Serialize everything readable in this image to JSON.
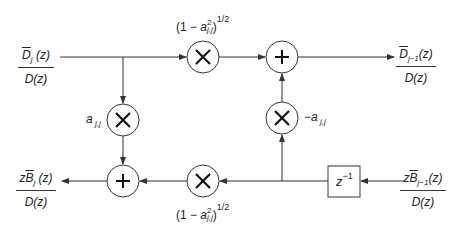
{
  "diagram": {
    "title": "",
    "inputs": {
      "top_left": {
        "num_base": "D",
        "num_sub": "j",
        "num_arg": " (z)",
        "den": "D(z)"
      },
      "bottom_right": {
        "num_prefix": "z",
        "num_base": "B",
        "num_sub": "j−1",
        "num_arg": "(z)",
        "den": "D(z)"
      }
    },
    "outputs": {
      "top_right": {
        "num_base": "D",
        "num_sub": "j−1",
        "num_arg": "(z)",
        "den": "D(z)"
      },
      "bottom_left": {
        "num_prefix": "z",
        "num_base": "B",
        "num_sub": "j",
        "num_arg": " (z)",
        "den": "D(z)"
      }
    },
    "gains": {
      "top_multiplier": {
        "pre": "(1 − ",
        "var": "a",
        "sup": "2",
        "sub": "j,j",
        "post": ")",
        "exp": "1/2"
      },
      "bottom_multiplier": {
        "pre": "(1 − ",
        "var": "a",
        "sup": "2",
        "sub": "j,j",
        "post": ")",
        "exp": "1/2"
      },
      "left_multiplier": {
        "var": "a",
        "sub": " j,j"
      },
      "right_multiplier": {
        "pre": "−",
        "var": "a",
        "sub": " j,j"
      }
    },
    "delay": {
      "base": "z",
      "exp": "−1"
    },
    "symbols": {
      "multiply": "×",
      "add": "+"
    },
    "colors": {
      "line": "#333333",
      "background": "#ffffff"
    }
  }
}
